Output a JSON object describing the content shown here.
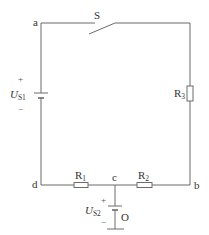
{
  "diagram": {
    "type": "circuit",
    "nodes": {
      "a": "a",
      "b": "b",
      "c": "c",
      "d": "d",
      "ground": "O"
    },
    "switch": {
      "label": "S",
      "state": "open"
    },
    "sources": [
      {
        "id": "US1",
        "symbol": "U",
        "subscript": "S1",
        "plus": "+",
        "minus": "−"
      },
      {
        "id": "US2",
        "symbol": "U",
        "subscript": "S2",
        "plus": "+",
        "minus": "−"
      }
    ],
    "resistors": [
      {
        "id": "R1",
        "symbol": "R",
        "subscript": "1"
      },
      {
        "id": "R2",
        "symbol": "R",
        "subscript": "2"
      },
      {
        "id": "R3",
        "symbol": "R",
        "subscript": "3"
      }
    ],
    "colors": {
      "wire": "#6b6b6b",
      "text": "#333333"
    }
  }
}
